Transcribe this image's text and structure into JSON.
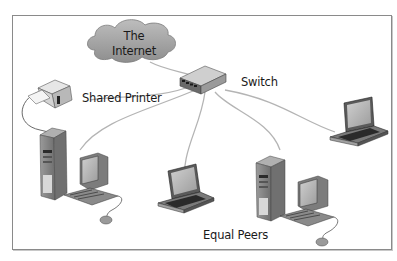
{
  "diagram": {
    "nodes": [
      {
        "id": "internet",
        "type": "cloud",
        "label_line1": "The",
        "label_line2": "Internet"
      },
      {
        "id": "switch",
        "type": "switch",
        "label": "Switch"
      },
      {
        "id": "printer",
        "type": "printer",
        "label": "Shared Printer"
      },
      {
        "id": "desktop-left",
        "type": "desktop"
      },
      {
        "id": "laptop-center",
        "type": "laptop"
      },
      {
        "id": "desktop-right",
        "type": "desktop"
      },
      {
        "id": "laptop-right",
        "type": "laptop"
      }
    ],
    "edges": [
      {
        "from": "internet",
        "to": "switch"
      },
      {
        "from": "switch",
        "to": "printer"
      },
      {
        "from": "switch",
        "to": "desktop-left"
      },
      {
        "from": "switch",
        "to": "laptop-center"
      },
      {
        "from": "switch",
        "to": "desktop-right"
      },
      {
        "from": "switch",
        "to": "laptop-right"
      }
    ],
    "group_label": "Equal Peers",
    "colors": {
      "frame": "#8a8a8a",
      "cloud_fill": "#a8a8a8",
      "cable": "#b0b0b0",
      "device_dark": "#3a3a3a",
      "device_mid": "#8c8c8c",
      "device_light": "#d6d6d6"
    }
  }
}
